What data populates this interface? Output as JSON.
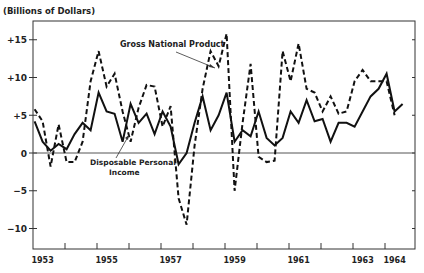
{
  "chart_data": {
    "type": "line",
    "title": "",
    "ylabel": "(Billions of Dollars)",
    "xlabel": "",
    "ylim": [
      -13,
      18
    ],
    "yticks": [
      {
        "value": 15,
        "label": "+15"
      },
      {
        "value": 10,
        "label": "+10"
      },
      {
        "value": 5,
        "label": "+5"
      },
      {
        "value": 0,
        "label": "0"
      },
      {
        "value": -5,
        "label": "−5"
      },
      {
        "value": -10,
        "label": "−10"
      }
    ],
    "xlim": [
      1953.0,
      1964.9
    ],
    "xtick_labels": [
      {
        "x": 1953.3,
        "label": "1953"
      },
      {
        "x": 1955.3,
        "label": "1955"
      },
      {
        "x": 1957.3,
        "label": "1957"
      },
      {
        "x": 1959.3,
        "label": "1959"
      },
      {
        "x": 1961.3,
        "label": "1961"
      },
      {
        "x": 1963.3,
        "label": "1963"
      },
      {
        "x": 1964.3,
        "label": "1964"
      }
    ],
    "grid": false,
    "zero_line": true,
    "series": [
      {
        "name": "Gross National Product",
        "style": "dashed",
        "x": [
          1953.05,
          1953.3,
          1953.55,
          1953.8,
          1954.05,
          1954.3,
          1954.55,
          1954.8,
          1955.05,
          1955.3,
          1955.55,
          1955.8,
          1956.05,
          1956.3,
          1956.55,
          1956.8,
          1957.05,
          1957.3,
          1957.55,
          1957.8,
          1958.05,
          1958.3,
          1958.55,
          1958.8,
          1959.05,
          1959.3,
          1959.55,
          1959.8,
          1960.05,
          1960.3,
          1960.55,
          1960.8,
          1961.05,
          1961.3,
          1961.55,
          1961.8,
          1962.05,
          1962.3,
          1962.55,
          1962.8,
          1963.05,
          1963.3,
          1963.55,
          1963.8,
          1964.05,
          1964.3,
          1964.55,
          1964.8
        ],
        "y": [
          5.8,
          4.2,
          -1.8,
          3.8,
          -1.2,
          -1.2,
          1.5,
          9.5,
          13.5,
          8.8,
          10.5,
          5.5,
          1.5,
          6,
          9,
          8.8,
          3.5,
          6.2,
          -6,
          -9.5,
          1,
          8.5,
          13.5,
          11.5,
          15.8,
          -5,
          4,
          11.8,
          -0.5,
          -1.2,
          -1,
          13.5,
          9.5,
          14.5,
          8.5,
          8,
          5.5,
          7.5,
          5.2,
          5.5,
          9.5,
          11,
          9.5,
          9.5,
          9.5,
          5,
          null,
          null
        ],
        "annotation": "Gross National Product"
      },
      {
        "name": "Disposable Personal Income",
        "style": "solid",
        "x": [
          1953.05,
          1953.3,
          1953.55,
          1953.8,
          1954.05,
          1954.3,
          1954.55,
          1954.8,
          1955.05,
          1955.3,
          1955.55,
          1955.8,
          1956.05,
          1956.3,
          1956.55,
          1956.8,
          1957.05,
          1957.3,
          1957.55,
          1957.8,
          1958.05,
          1958.3,
          1958.55,
          1958.8,
          1959.05,
          1959.3,
          1959.55,
          1959.8,
          1960.05,
          1960.3,
          1960.55,
          1960.8,
          1961.05,
          1961.3,
          1961.55,
          1961.8,
          1962.05,
          1962.3,
          1962.55,
          1962.8,
          1963.05,
          1963.3,
          1963.55,
          1963.8,
          1964.05,
          1964.3,
          1964.55,
          1964.8
        ],
        "y": [
          4.2,
          1.5,
          0.3,
          1.2,
          0.5,
          2.5,
          4,
          3,
          8,
          5.5,
          5.2,
          1.5,
          6.5,
          4,
          5.2,
          2.5,
          5.5,
          3.5,
          -1.5,
          0,
          4,
          7.5,
          3,
          5,
          8,
          1.5,
          3,
          2.2,
          5.5,
          2,
          1,
          2,
          5.5,
          4,
          7,
          4.2,
          4.5,
          1.5,
          4,
          4,
          3.5,
          5.5,
          7.5,
          8.5,
          10.5,
          5.5,
          6.5,
          null
        ],
        "annotation": "Disposable Personal Income"
      }
    ]
  },
  "labels": {
    "units": "(Billions of Dollars)",
    "gnp": "Gross National Product",
    "dpi_line1": "Disposable Personal",
    "dpi_line2": "Income"
  }
}
